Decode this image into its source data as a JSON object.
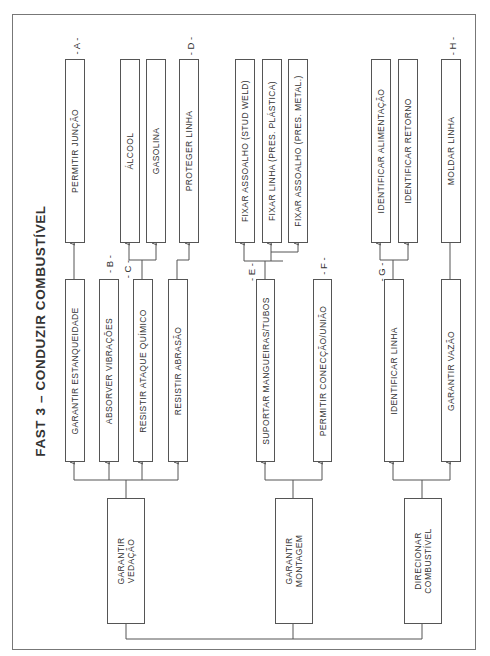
{
  "title": "FAST 3 – CONDUZIR COMBUSTÍVEL",
  "roots": [
    {
      "label_line1": "GARANTIR",
      "label_line2": "VEDAÇÃO"
    },
    {
      "label_line1": "GARANTIR",
      "label_line2": "MONTAGEM"
    },
    {
      "label_line1": "DIRECIONAR",
      "label_line2": "COMBUSTÍVEL"
    }
  ],
  "level2": [
    {
      "label": "GARANTIR ESTANQUEIDADE"
    },
    {
      "label": "ABSORVER VIBRAÇÕES",
      "tag": "- B -"
    },
    {
      "label": "RESISTIR ATAQUE QUÍMICO",
      "tag": "- C -"
    },
    {
      "label": "RESISTIR ABRASÃO"
    },
    {
      "label": "SUPORTAR MANGUEIRAS/TUBOS",
      "tag": "- E -"
    },
    {
      "label": "PERMITIR CONECÇÃO/UNIÃO",
      "tag": "- F -"
    },
    {
      "label": "IDENTIFICAR LINHA",
      "tag": "- G -"
    },
    {
      "label": "GARANTIR VAZÃO"
    }
  ],
  "level3": [
    {
      "label": "PERMITIR JUNÇÃO",
      "tag": "- A -"
    },
    {
      "label": "ÁLCOOL"
    },
    {
      "label": "GASOLINA"
    },
    {
      "label": "PROTEGER LINHA",
      "tag": "- D -"
    },
    {
      "label": "FIXAR ASSOALHO (STUD WELD)"
    },
    {
      "label": "FIXAR LINHA (PRES. PLÁSTICA)"
    },
    {
      "label": "FIXAR ASSOALHO (PRES. METAL.)"
    },
    {
      "label": "IDENTIFICAR ALIMENTAÇÃO"
    },
    {
      "label": "IDENTIFICAR RETORNO"
    },
    {
      "label": "MOLDAR LINHA",
      "tag": "- H -"
    }
  ]
}
